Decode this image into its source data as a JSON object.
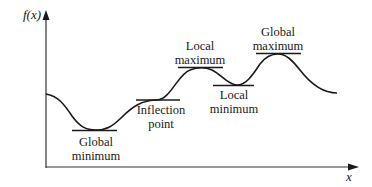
{
  "diagram": {
    "type": "function-extrema-illustration",
    "colors": {
      "curve": "#1a1a1a",
      "axis": "#333333",
      "tangent": "#1a1a1a",
      "text": "#1a1a1a",
      "background": "#ffffff"
    },
    "axes": {
      "y_label": "f(x)",
      "x_label": "x"
    },
    "annotations": [
      {
        "id": "global-minimum",
        "lines": [
          "Global",
          "minimum"
        ]
      },
      {
        "id": "inflection-point",
        "lines": [
          "Inflection",
          "point"
        ]
      },
      {
        "id": "local-maximum",
        "lines": [
          "Local",
          "maximum"
        ]
      },
      {
        "id": "local-minimum",
        "lines": [
          "Local",
          "minimum"
        ]
      },
      {
        "id": "global-maximum",
        "lines": [
          "Global",
          "maximum"
        ]
      }
    ]
  }
}
